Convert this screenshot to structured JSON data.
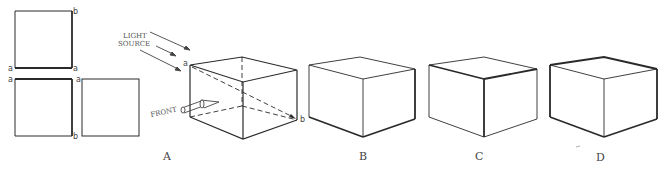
{
  "squares": {
    "top_square": {
      "corner_labels": {
        "top_right": "b",
        "bottom_left": "a",
        "bottom_right": "a"
      }
    },
    "bottom_left_square": {
      "corner_labels": {
        "top_left": "a",
        "bottom_right": "b"
      }
    },
    "bottom_right_square": {
      "corner_labels": {
        "top_left": "a"
      }
    }
  },
  "annotations": {
    "light_source_line1": "LIGHT",
    "light_source_line2": "SOURCE",
    "front": "FRONT",
    "corner_a": "a",
    "corner_b": "b"
  },
  "figure_labels": {
    "a": "A",
    "b": "B",
    "c": "C",
    "d": "D"
  },
  "colors": {
    "line": "#2a2a2a",
    "text": "#444444",
    "background": "#ffffff"
  }
}
